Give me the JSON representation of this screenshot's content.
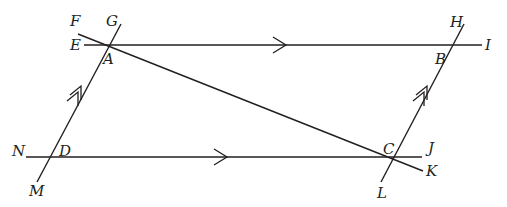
{
  "diagram": {
    "type": "geometry",
    "stroke_color": "#231f20",
    "background": "#ffffff",
    "points": {
      "A": {
        "label": "A",
        "x": 108,
        "y": 45
      },
      "B": {
        "label": "B",
        "x": 453,
        "y": 45
      },
      "C": {
        "label": "C",
        "x": 393,
        "y": 157
      },
      "D": {
        "label": "D",
        "x": 50,
        "y": 157
      },
      "E": {
        "label": "E",
        "x": 84,
        "y": 45
      },
      "F": {
        "label": "F",
        "x": 78,
        "y": 34
      },
      "G": {
        "label": "G",
        "x": 121,
        "y": 24
      },
      "H": {
        "label": "H",
        "x": 464,
        "y": 24
      },
      "I": {
        "label": "I",
        "x": 482,
        "y": 45
      },
      "J": {
        "label": "J",
        "x": 422,
        "y": 157
      },
      "K": {
        "label": "K",
        "x": 423,
        "y": 171
      },
      "L": {
        "label": "L",
        "x": 381,
        "y": 182
      },
      "M": {
        "label": "M",
        "x": 37,
        "y": 182
      },
      "N": {
        "label": "N",
        "x": 26,
        "y": 157
      }
    },
    "lines": [
      {
        "name": "line-EI",
        "through": [
          "E",
          "A",
          "B",
          "I"
        ],
        "marker": "single-arrow"
      },
      {
        "name": "line-NJ",
        "through": [
          "N",
          "D",
          "C",
          "J"
        ],
        "marker": "single-arrow"
      },
      {
        "name": "line-MG",
        "through": [
          "M",
          "D",
          "A",
          "G"
        ],
        "marker": "double-arrow"
      },
      {
        "name": "line-LH",
        "through": [
          "L",
          "C",
          "B",
          "H"
        ],
        "marker": "double-arrow"
      },
      {
        "name": "line-FK",
        "through": [
          "F",
          "A",
          "C",
          "K"
        ],
        "marker": "none"
      }
    ],
    "labels": {
      "F": "F",
      "G": "G",
      "E": "E",
      "A": "A",
      "H": "H",
      "I": "I",
      "B": "B",
      "N": "N",
      "D": "D",
      "M": "M",
      "C": "C",
      "J": "J",
      "L": "L",
      "K": "K"
    }
  }
}
